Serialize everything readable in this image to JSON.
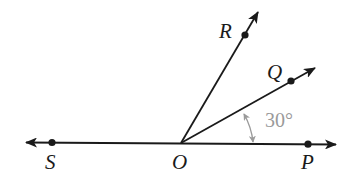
{
  "diagram": {
    "type": "geometry-angles",
    "colors": {
      "line": "#1a1a1a",
      "annotation": "#9a9a9a",
      "background": "#ffffff"
    },
    "points": [
      {
        "id": "S",
        "label": "S"
      },
      {
        "id": "O",
        "label": "O"
      },
      {
        "id": "P",
        "label": "P"
      },
      {
        "id": "Q",
        "label": "Q"
      },
      {
        "id": "R",
        "label": "R"
      }
    ],
    "lines": [
      {
        "name": "line-SP",
        "through": [
          "S",
          "O",
          "P"
        ],
        "arrows": "both"
      },
      {
        "name": "ray-OQ",
        "from": "O",
        "through": "Q",
        "arrows": "end"
      },
      {
        "name": "ray-OR",
        "from": "O",
        "through": "R",
        "arrows": "end"
      }
    ],
    "angles": [
      {
        "name": "angle-QOP",
        "vertex": "O",
        "between": [
          "P",
          "Q"
        ],
        "label": "30°"
      }
    ]
  }
}
